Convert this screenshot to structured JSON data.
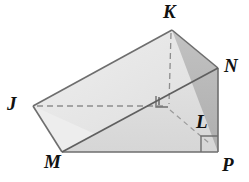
{
  "figure": {
    "kind": "geometric-solid-diagram",
    "background_color": "#ffffff",
    "stroke_color": "#6e6e6e",
    "dashed_stroke_color": "#8a8a8a",
    "label_color": "#111111",
    "faces": [
      {
        "name": "top-slanted-face",
        "fill": "#e6e6e6",
        "points": "33,106 172,30 218,68 62,152"
      },
      {
        "name": "right-triangle-face",
        "fill": "#b6b6b6",
        "points": "172,30 218,68 218,152"
      },
      {
        "name": "front-lower-face",
        "fill": "#dedede",
        "points": "62,152 218,152 218,68"
      },
      {
        "name": "left-bottom-face",
        "fill": "#ececec",
        "points": "33,106 62,152 90,131"
      }
    ],
    "solid_edges": [
      {
        "name": "edge-J-K",
        "from": "33,106",
        "to": "172,30"
      },
      {
        "name": "edge-K-N",
        "from": "172,30",
        "to": "218,68"
      },
      {
        "name": "edge-J-M",
        "from": "33,106",
        "to": "62,152"
      },
      {
        "name": "edge-M-P",
        "from": "62,152",
        "to": "218,152"
      },
      {
        "name": "edge-N-P",
        "from": "218,68",
        "to": "218,152"
      },
      {
        "name": "edge-M-N",
        "from": "62,152",
        "to": "218,68"
      }
    ],
    "dashed_edges": [
      {
        "name": "hidden-edge-J-L",
        "from": "33,106",
        "to": "166,106"
      },
      {
        "name": "hidden-edge-K-L",
        "from": "172,30",
        "to": "169,106"
      },
      {
        "name": "hidden-edge-L-P",
        "from": "169,108",
        "to": "212,145"
      }
    ],
    "right_angle_markers": [
      {
        "name": "right-angle-marker-interior",
        "x": 156,
        "y": 94,
        "size": 12
      },
      {
        "name": "right-angle-marker-at-P",
        "x": 202,
        "y": 136,
        "size": 16
      }
    ],
    "vertices": [
      {
        "id": "K",
        "label": "K",
        "x": 172,
        "y": 30,
        "label_x": 163,
        "label_y": 2
      },
      {
        "id": "N",
        "label": "N",
        "x": 218,
        "y": 68,
        "label_x": 224,
        "label_y": 56
      },
      {
        "id": "J",
        "label": "J",
        "x": 33,
        "y": 106,
        "label_x": 7,
        "label_y": 94
      },
      {
        "id": "L",
        "label": "L",
        "x": 202,
        "y": 136,
        "label_x": 196,
        "label_y": 112
      },
      {
        "id": "M",
        "label": "M",
        "x": 62,
        "y": 152,
        "label_x": 44,
        "label_y": 152
      },
      {
        "id": "P",
        "label": "P",
        "x": 218,
        "y": 152,
        "label_x": 222,
        "label_y": 155
      }
    ]
  }
}
